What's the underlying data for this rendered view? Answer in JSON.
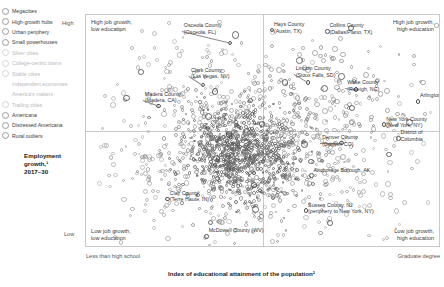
{
  "legend": {
    "items": [
      {
        "label": "Megacities",
        "marker": "circle"
      },
      {
        "label": "High-growth hubs",
        "marker": "circle"
      },
      {
        "label": "Urban periphery",
        "marker": "circle"
      },
      {
        "label": "Small powerhouses",
        "marker": "circle"
      },
      {
        "label": "Silver cities",
        "marker": "circle-faint"
      },
      {
        "label": "College-centric towns",
        "marker": "circle-faint"
      },
      {
        "label": "Stable cities",
        "marker": "circle-faint"
      },
      {
        "label": "Independent economies",
        "marker": "none"
      },
      {
        "label": "America's makers",
        "marker": "none"
      },
      {
        "label": "Trailing cities",
        "marker": "circle-faint"
      },
      {
        "label": "Americana",
        "marker": "circle"
      },
      {
        "label": "Distressed Americana",
        "marker": "circle"
      },
      {
        "label": "Rural outliers",
        "marker": "circle"
      }
    ]
  },
  "axes": {
    "y_title_line1": "Employment",
    "y_title_line2": "growth,¹",
    "y_title_line3": "2017–30",
    "y_high": "High",
    "y_low": "Low",
    "x_title": "Index of educational attainment of the population²",
    "x_low": "Less than high school",
    "x_high": "Graduate degree"
  },
  "quadrants": {
    "top_left_l1": "High job growth,",
    "top_left_l2": "low education",
    "top_right_l1": "High job growth,",
    "top_right_l2": "high education",
    "bottom_left_l1": "Low job growth,",
    "bottom_left_l2": "low education",
    "bottom_right_l1": "Low job growth,",
    "bottom_right_l2": "high education"
  },
  "chart_data": {
    "type": "scatter",
    "title": "",
    "xlabel": "Index of educational attainment of the population²",
    "ylabel": "Employment growth,¹ 2017–30",
    "xlim": [
      0,
      100
    ],
    "ylim": [
      0,
      100
    ],
    "grid": false,
    "legend_position": "left-outside",
    "annotations": [
      {
        "label_l1": "Osceola County",
        "label_l2": "(Osceola, FL)",
        "x": 40.6,
        "y": 88.0,
        "anchor": "start",
        "lx": 27.0,
        "ly": 93.0
      },
      {
        "label_l1": "Hays County",
        "label_l2": "(Austin, TX)",
        "x": 52.4,
        "y": 93.5,
        "anchor": "start",
        "lx": 52.4,
        "ly": 93.5
      },
      {
        "label_l1": "Collins County",
        "label_l2": "(Dallas/Plano, TX)",
        "x": 68.0,
        "y": 93.0,
        "anchor": "start",
        "lx": 68.0,
        "ly": 93.0
      },
      {
        "label_l1": "Clark County",
        "label_l2": "(Las Vegas, NV)",
        "x": 33.0,
        "y": 70.0,
        "anchor": "start",
        "lx": 29.0,
        "ly": 74.0
      },
      {
        "label_l1": "Lincoln County",
        "label_l2": "(Sioux Falls, SD)",
        "x": 62.5,
        "y": 71.0,
        "anchor": "start",
        "lx": 58.5,
        "ly": 74.5
      },
      {
        "label_l1": "Wake County",
        "label_l2": "(Raleigh, NC)",
        "x": 76.0,
        "y": 68.0,
        "anchor": "start",
        "lx": 73.0,
        "ly": 68.5
      },
      {
        "label_l1": "Arlington, VA",
        "label_l2": "",
        "x": 93.5,
        "y": 63.0,
        "anchor": "start",
        "lx": 93.5,
        "ly": 63.0
      },
      {
        "label_l1": "Madera County",
        "label_l2": "(Madera, CA)",
        "x": 20.5,
        "y": 61.0,
        "anchor": "start",
        "lx": 16.0,
        "ly": 63.5
      },
      {
        "label_l1": "New York County",
        "label_l2": "(New York, NY)",
        "x": 84.0,
        "y": 53.0,
        "anchor": "start",
        "lx": 84.0,
        "ly": 53.0
      },
      {
        "label_l1": "District of",
        "label_l2": "Columbia",
        "x": 88.0,
        "y": 47.0,
        "anchor": "start",
        "lx": 88.0,
        "ly": 47.0
      },
      {
        "label_l1": "Denver County",
        "label_l2": "(Denver, CO)",
        "x": 72.0,
        "y": 45.0,
        "anchor": "start",
        "lx": 66.0,
        "ly": 45.0
      },
      {
        "label_l1": "Anchorage Borough, AK",
        "label_l2": "",
        "x": 63.5,
        "y": 31.0,
        "anchor": "start",
        "lx": 63.5,
        "ly": 31.0
      },
      {
        "label_l1": "Sussex County, NJ",
        "label_l2": "(periphery to New York, NY)",
        "x": 62.0,
        "y": 16.0,
        "anchor": "start",
        "lx": 62.0,
        "ly": 16.0
      },
      {
        "label_l1": "Clay County",
        "label_l2": "(Terre Haute, IN)",
        "x": 23.0,
        "y": 21.0,
        "anchor": "start",
        "lx": 23.0,
        "ly": 21.0
      },
      {
        "label_l1": "McDowell County (WV)",
        "label_l2": "",
        "x": 34.0,
        "y": 5.0,
        "anchor": "start",
        "lx": 34.0,
        "ly": 5.0
      }
    ]
  }
}
